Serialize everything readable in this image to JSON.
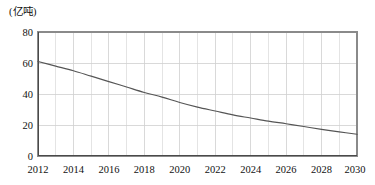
{
  "figure": {
    "unit_label": "(亿吨)"
  },
  "chart_data": {
    "type": "line",
    "title": "",
    "subtitle": "",
    "xlabel": "",
    "ylabel": "(亿吨)",
    "grid": true,
    "legend": null,
    "xlim": [
      2012,
      2030
    ],
    "ylim": [
      0,
      80
    ],
    "x_tick_labels": [
      "2012",
      "2014",
      "2016",
      "2018",
      "2020",
      "2022",
      "2024",
      "2026",
      "2028",
      "2030"
    ],
    "x_ticks": [
      2012,
      2014,
      2016,
      2018,
      2020,
      2022,
      2024,
      2026,
      2028,
      2030
    ],
    "x_minor_ticks": [
      2013,
      2015,
      2017,
      2019,
      2021,
      2023,
      2025,
      2027,
      2029
    ],
    "y_tick_labels": [
      "0",
      "20",
      "40",
      "60",
      "80"
    ],
    "y_ticks": [
      0,
      20,
      40,
      60,
      80
    ],
    "x": [
      2012,
      2013,
      2014,
      2015,
      2016,
      2017,
      2018,
      2019,
      2020,
      2021,
      2022,
      2023,
      2024,
      2025,
      2026,
      2027,
      2028,
      2029,
      2030
    ],
    "values": [
      61,
      58,
      55,
      51.5,
      48,
      44.5,
      41,
      38,
      34.5,
      31.5,
      29,
      26.5,
      24.5,
      22.5,
      20.8,
      19,
      17.2,
      15.6,
      14
    ],
    "series": [
      {
        "name": "",
        "values": [
          61,
          58,
          55,
          51.5,
          48,
          44.5,
          41,
          38,
          34.5,
          31.5,
          29,
          26.5,
          24.5,
          22.5,
          20.8,
          19,
          17.2,
          15.6,
          14
        ]
      }
    ],
    "colors": {
      "line": "#555555",
      "grid": "#d9d9d9",
      "border": "#8a8a8a",
      "text": "#111111",
      "background": "#ffffff"
    }
  }
}
